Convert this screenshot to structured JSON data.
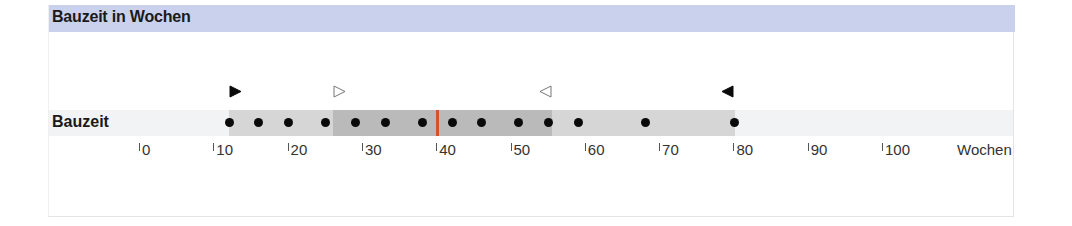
{
  "header": {
    "title": "Bauzeit in Wochen"
  },
  "colors": {
    "header_bg": "#c9d1ec",
    "range_bar": "#d6d6d6",
    "iqr_bar": "#bababa",
    "median": "#d2532e",
    "dot": "#0a0a0a"
  },
  "chart_data": {
    "type": "scatter",
    "title": "Bauzeit in Wochen",
    "xlabel": "Wochen",
    "ylabel": "",
    "row_label": "Bauzeit",
    "xlim": [
      0,
      100
    ],
    "x_ticks": [
      0,
      10,
      20,
      30,
      40,
      50,
      60,
      70,
      80,
      90,
      100
    ],
    "x_tick_labels": [
      "0",
      "10",
      "20",
      "30",
      "40",
      "50",
      "60",
      "70",
      "80",
      "90",
      "100"
    ],
    "grid": false,
    "legend": null,
    "points": [
      12,
      16,
      20,
      25,
      29,
      33,
      38,
      42,
      46,
      51,
      55,
      59,
      68,
      80
    ],
    "range": {
      "min": 12,
      "max": 80
    },
    "middle_band": {
      "from": 26,
      "to": 55.5
    },
    "median": 40,
    "markers": [
      {
        "type": "filled-right-triangle",
        "x": 12,
        "meaning": "minimum"
      },
      {
        "type": "hollow-right-triangle",
        "x": 26,
        "meaning": "lower band bound"
      },
      {
        "type": "hollow-left-triangle",
        "x": 55.5,
        "meaning": "upper band bound"
      },
      {
        "type": "filled-left-triangle",
        "x": 80,
        "meaning": "maximum"
      }
    ]
  }
}
